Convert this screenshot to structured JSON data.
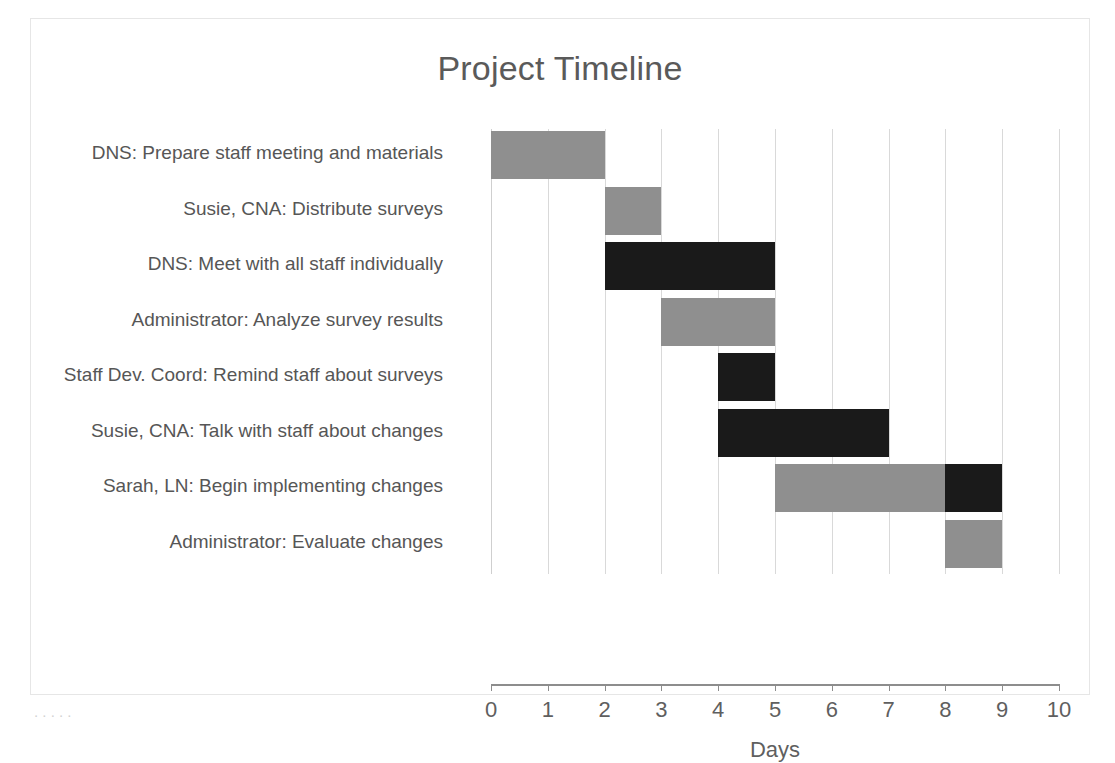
{
  "chart_data": {
    "type": "bar",
    "subtype": "gantt",
    "title": "Project Timeline",
    "xlabel": "Days",
    "ylabel": "",
    "xlim": [
      0,
      10
    ],
    "xticks": [
      "0",
      "1",
      "2",
      "3",
      "4",
      "5",
      "6",
      "7",
      "8",
      "9",
      "10"
    ],
    "grid": true,
    "legend": "none",
    "orientation": "horizontal",
    "colors": {
      "gray": "#8f8f8f",
      "black": "#1a1a1a",
      "gridline": "#d9d9d9",
      "axis": "#8d8d8d",
      "text": "#565656",
      "title_text": "#5a5a5a",
      "frame": "#e6e6e6"
    },
    "categories": [
      "DNS: Prepare staff meeting and materials",
      "Susie, CNA: Distribute surveys",
      "DNS: Meet with all staff individually",
      "Administrator: Analyze survey results",
      "Staff Dev. Coord: Remind staff about surveys",
      "Susie, CNA: Talk with staff about changes",
      "Sarah, LN: Begin implementing changes",
      "Administrator: Evaluate changes"
    ],
    "tasks": [
      {
        "label": "DNS: Prepare staff meeting and materials",
        "start": 0,
        "end": 2,
        "duration": 2,
        "segments": [
          {
            "start": 0,
            "end": 2,
            "color": "gray"
          }
        ]
      },
      {
        "label": "Susie, CNA: Distribute surveys",
        "start": 2,
        "end": 3,
        "duration": 1,
        "segments": [
          {
            "start": 2,
            "end": 3,
            "color": "gray"
          }
        ]
      },
      {
        "label": "DNS: Meet with all staff individually",
        "start": 2,
        "end": 5,
        "duration": 3,
        "segments": [
          {
            "start": 2,
            "end": 5,
            "color": "black"
          }
        ]
      },
      {
        "label": "Administrator: Analyze survey results",
        "start": 3,
        "end": 5,
        "duration": 2,
        "segments": [
          {
            "start": 3,
            "end": 5,
            "color": "gray"
          }
        ]
      },
      {
        "label": "Staff Dev. Coord: Remind staff about surveys",
        "start": 4,
        "end": 5,
        "duration": 1,
        "segments": [
          {
            "start": 4,
            "end": 5,
            "color": "black"
          }
        ]
      },
      {
        "label": "Susie, CNA: Talk with staff about changes",
        "start": 4,
        "end": 7,
        "duration": 3,
        "segments": [
          {
            "start": 4,
            "end": 7,
            "color": "black"
          }
        ]
      },
      {
        "label": "Sarah, LN: Begin implementing changes",
        "start": 5,
        "end": 9,
        "duration": 4,
        "segments": [
          {
            "start": 5,
            "end": 8,
            "color": "gray"
          },
          {
            "start": 8,
            "end": 9,
            "color": "black"
          }
        ]
      },
      {
        "label": "Administrator: Evaluate changes",
        "start": 8,
        "end": 9,
        "duration": 1,
        "segments": [
          {
            "start": 8,
            "end": 9,
            "color": "gray"
          }
        ]
      }
    ]
  },
  "page": {
    "bottom_cut_text": ". .  .    .        ."
  }
}
